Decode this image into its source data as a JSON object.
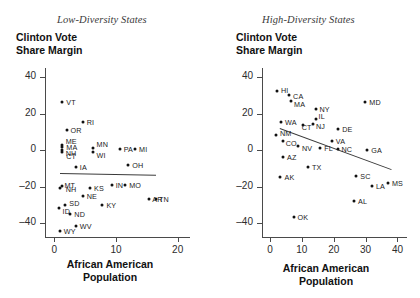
{
  "figure": {
    "ylabel": "Clinton Vote\nShare Margin",
    "xlabel": "African American\nPopulation"
  },
  "panels": [
    {
      "id": "low-diversity",
      "title": "Low-Diversity States",
      "ylabel_line1": "Clinton Vote",
      "ylabel_line2": "Share Margin",
      "xlabel_line1": "African American",
      "xlabel_line2": "Population"
    },
    {
      "id": "high-diversity",
      "title": "High-Diversity States",
      "ylabel_line1": "Clinton Vote",
      "ylabel_line2": "Share Margin",
      "xlabel_line1": "African American",
      "xlabel_line2": "Population"
    }
  ],
  "chart_data": [
    {
      "type": "scatter",
      "title": "Low-Diversity States",
      "xlabel": "African American Population",
      "ylabel": "Clinton Vote Share Margin",
      "xlim": [
        -1.5,
        22
      ],
      "ylim": [
        -48,
        45
      ],
      "xticks": [
        0,
        10,
        20
      ],
      "yticks": [
        40,
        20,
        0,
        -20,
        -40
      ],
      "grid": false,
      "legend": "none",
      "point_labels": true,
      "trendline": {
        "x0": 1.0,
        "y0": -12.5,
        "x1": 16.5,
        "y1": -13.5
      },
      "points": [
        {
          "label": "VT",
          "x": 1.3,
          "y": 26.4
        },
        {
          "label": "RI",
          "x": 4.6,
          "y": 15.5
        },
        {
          "label": "OR",
          "x": 2.0,
          "y": 10.9
        },
        {
          "label": "ME",
          "x": 1.2,
          "y": 3.0
        },
        {
          "label": "NH",
          "x": 1.2,
          "y": 0.4
        },
        {
          "label": "MA",
          "x": 1.3,
          "y": 1.6
        },
        {
          "label": "CT",
          "x": 1.3,
          "y": -1.0
        },
        {
          "label": "MN",
          "x": 6.2,
          "y": 1.5
        },
        {
          "label": "WI",
          "x": 6.2,
          "y": -0.8
        },
        {
          "label": "PA",
          "x": 10.6,
          "y": 0.7
        },
        {
          "label": "MI",
          "x": 13.1,
          "y": 0.7
        },
        {
          "label": "IA",
          "x": 3.5,
          "y": -9.4
        },
        {
          "label": "OH",
          "x": 12.0,
          "y": -8.1
        },
        {
          "label": "MT",
          "x": 1.0,
          "y": -20.4
        },
        {
          "label": "NH",
          "x": 1.2,
          "y": -19.4
        },
        {
          "label": "KS",
          "x": 5.8,
          "y": -20.6
        },
        {
          "label": "IN",
          "x": 9.3,
          "y": -19.0
        },
        {
          "label": "MO",
          "x": 11.5,
          "y": -18.8
        },
        {
          "label": "NE",
          "x": 4.6,
          "y": -25.0
        },
        {
          "label": "SD",
          "x": 1.8,
          "y": -29.8
        },
        {
          "label": "ID",
          "x": 0.7,
          "y": -31.8
        },
        {
          "label": "KY",
          "x": 7.8,
          "y": -29.8
        },
        {
          "label": "ND",
          "x": 2.6,
          "y": -35.0
        },
        {
          "label": "WV",
          "x": 3.5,
          "y": -41.5
        },
        {
          "label": "WY",
          "x": 0.9,
          "y": -44.0
        },
        {
          "label": "AR",
          "x": 15.4,
          "y": -26.9
        },
        {
          "label": "TN",
          "x": 16.5,
          "y": -26.9
        }
      ]
    },
    {
      "type": "scatter",
      "title": "High-Diversity States",
      "xlabel": "African American Population",
      "ylabel": "Clinton Vote Share Margin",
      "xlim": [
        -2.5,
        43
      ],
      "ylim": [
        -48,
        45
      ],
      "xticks": [
        0,
        10,
        20,
        30,
        40
      ],
      "yticks": [
        40,
        20,
        0,
        -20,
        -40
      ],
      "grid": false,
      "legend": "none",
      "point_labels": true,
      "trendline": {
        "x0": 3.0,
        "y0": 12.0,
        "x1": 38.0,
        "y1": -10.5
      },
      "points": [
        {
          "label": "HI",
          "x": 2.2,
          "y": 32.2
        },
        {
          "label": "CA",
          "x": 6.0,
          "y": 30.1
        },
        {
          "label": "MA",
          "x": 6.6,
          "y": 27.2
        },
        {
          "label": "MD",
          "x": 29.9,
          "y": 26.4
        },
        {
          "label": "NY",
          "x": 14.3,
          "y": 22.5
        },
        {
          "label": "WA",
          "x": 3.5,
          "y": 15.7
        },
        {
          "label": "IL",
          "x": 14.3,
          "y": 17.1
        },
        {
          "label": "CT",
          "x": 10.3,
          "y": 13.6
        },
        {
          "label": "NJ",
          "x": 13.5,
          "y": 14.1
        },
        {
          "label": "DE",
          "x": 21.4,
          "y": 11.4
        },
        {
          "label": "NM",
          "x": 1.9,
          "y": 8.2
        },
        {
          "label": "CO",
          "x": 4.0,
          "y": 4.9
        },
        {
          "label": "VA",
          "x": 19.4,
          "y": 5.3
        },
        {
          "label": "NV",
          "x": 8.8,
          "y": 2.4
        },
        {
          "label": "FL",
          "x": 15.8,
          "y": 1.2
        },
        {
          "label": "NC",
          "x": 21.2,
          "y": 0.6
        },
        {
          "label": "GA",
          "x": 30.5,
          "y": 0.0
        },
        {
          "label": "AZ",
          "x": 4.1,
          "y": -3.5
        },
        {
          "label": "TX",
          "x": 11.9,
          "y": -9.0
        },
        {
          "label": "SC",
          "x": 27.1,
          "y": -14.3
        },
        {
          "label": "AK",
          "x": 3.3,
          "y": -14.7
        },
        {
          "label": "MS",
          "x": 37.0,
          "y": -17.8
        },
        {
          "label": "LA",
          "x": 32.0,
          "y": -19.6
        },
        {
          "label": "AL",
          "x": 26.4,
          "y": -27.7
        },
        {
          "label": "OK",
          "x": 7.4,
          "y": -36.4
        }
      ]
    }
  ]
}
